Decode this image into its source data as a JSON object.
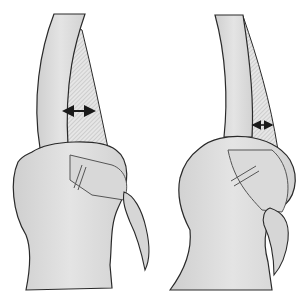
{
  "figure": {
    "panels": [
      {
        "id": "left",
        "description": "Specimen with wider hatched band",
        "measurement_arrow": {
          "orientation": "horizontal",
          "style": "double-headed",
          "relative_width": "wide"
        }
      },
      {
        "id": "right",
        "description": "Specimen with narrower hatched band",
        "measurement_arrow": {
          "orientation": "horizontal",
          "style": "double-headed",
          "relative_width": "narrow"
        }
      }
    ],
    "colors": {
      "background": "#ffffff",
      "fill": "#dcdcdc",
      "fill_light": "#e8e8e8",
      "outline": "#2a2a2a",
      "hatch": "#b0b0b0"
    }
  }
}
